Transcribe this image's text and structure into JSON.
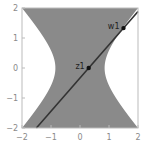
{
  "chart_data": {
    "type": "region",
    "title": "",
    "xlabel": "",
    "ylabel": "",
    "xlim": [
      -2,
      2
    ],
    "ylim": [
      -2,
      2
    ],
    "grid": false,
    "x_ticks": [
      -2,
      -1,
      0,
      1,
      2
    ],
    "y_ticks": [
      -2,
      -1,
      0,
      1,
      2
    ],
    "x_tick_labels": [
      "−2",
      "−1",
      "0",
      "1",
      "2"
    ],
    "y_tick_labels": [
      "−2",
      "−1",
      "0",
      "1",
      "2"
    ],
    "region": {
      "description": "shaded hyperbolic region x^2 <= a + b*y^2",
      "a": 0.72,
      "b": 0.82,
      "fill": "#8a8a8a"
    },
    "line": {
      "through": [
        [
          0.3,
          0.0
        ],
        [
          1.5,
          1.33
        ]
      ],
      "color": "#333333"
    },
    "points": [
      {
        "label": "z1",
        "x": 0.3,
        "y": 0.0
      },
      {
        "label": "w1",
        "x": 1.5,
        "y": 1.33
      }
    ]
  },
  "colors": {
    "frame": "#bbbbbb",
    "region": "#8a8a8a",
    "line": "#333333",
    "tick_text": "#8a8a8a"
  },
  "layout": {
    "frame": {
      "left": 22,
      "right": 138,
      "top": 8,
      "bottom": 128
    }
  }
}
